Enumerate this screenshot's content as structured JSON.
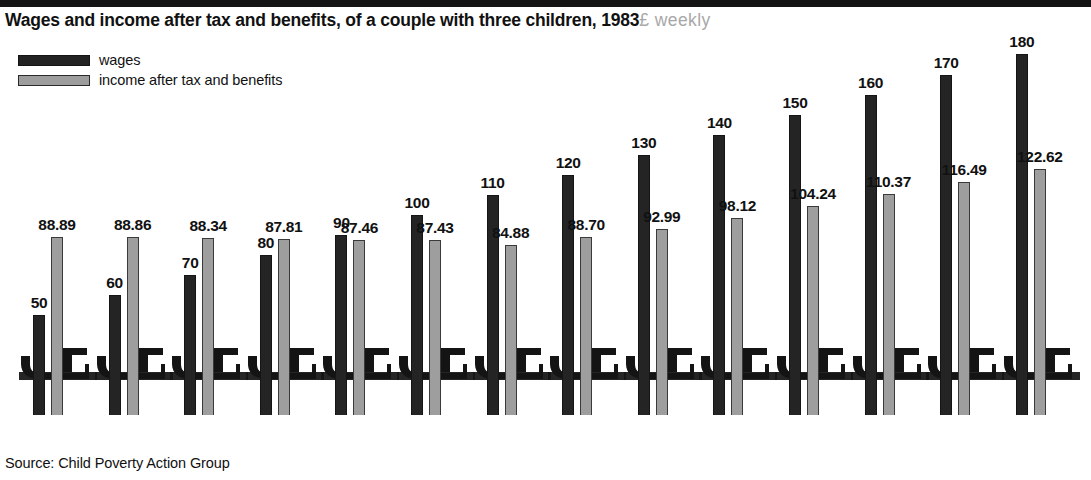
{
  "header": {
    "title_main": "Wages and income after tax and benefits, of a couple with three children, 1983",
    "title_unit": "£ weekly"
  },
  "legend": {
    "items": [
      {
        "label": "wages",
        "swatch": "dark-swatch-icon",
        "color": "#232323"
      },
      {
        "label": "income after tax and benefits",
        "swatch": "gray-swatch-icon",
        "color": "#9d9d9d"
      }
    ]
  },
  "source": {
    "text": "Source: Child Poverty Action Group"
  },
  "chart_data": {
    "type": "bar",
    "title": "Wages and income after tax and benefits, of a couple with three children, 1983",
    "subtitle": "£ weekly",
    "xlabel": "",
    "ylabel": "£ weekly",
    "ylim": [
      0,
      190
    ],
    "grid": false,
    "legend_position": "top-left",
    "categories": [
      "50",
      "60",
      "70",
      "80",
      "90",
      "100",
      "110",
      "120",
      "130",
      "140",
      "150",
      "160",
      "170",
      "180"
    ],
    "series": [
      {
        "name": "wages",
        "color": "#232323",
        "values": [
          50,
          60,
          70,
          80,
          90,
          100,
          110,
          120,
          130,
          140,
          150,
          160,
          170,
          180
        ],
        "labels": [
          "50",
          "60",
          "70",
          "80",
          "90",
          "100",
          "110",
          "120",
          "130",
          "140",
          "150",
          "160",
          "170",
          "180"
        ]
      },
      {
        "name": "income after tax and benefits",
        "color": "#9d9d9d",
        "values": [
          88.89,
          88.86,
          88.34,
          87.81,
          87.46,
          87.43,
          84.88,
          88.7,
          92.99,
          98.12,
          104.24,
          110.37,
          116.49,
          122.62
        ],
        "labels": [
          "88.89",
          "88.86",
          "88.34",
          "87.81",
          "87.46",
          "87.43",
          "84.88",
          "88.70",
          "92.99",
          "98.12",
          "104.24",
          "110.37",
          "116.49",
          "122.62"
        ]
      }
    ],
    "annotations": [
      "Source: Child Poverty Action Group"
    ]
  }
}
